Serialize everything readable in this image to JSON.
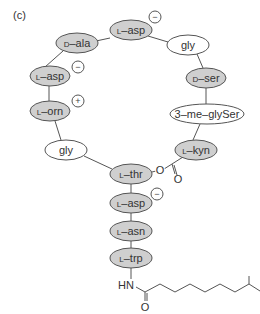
{
  "panel_label": "(c)",
  "colors": {
    "shaded_fill": "#cfcfcf",
    "white_fill": "#ffffff",
    "stroke": "#555555",
    "text": "#333333"
  },
  "nodes": [
    {
      "id": "l-asp-1",
      "prefix": "L",
      "name": "asp",
      "cx": 131,
      "cy": 30,
      "rx": 21,
      "ry": 10,
      "shaded": true
    },
    {
      "id": "d-ala",
      "prefix": "D",
      "name": "ala",
      "cx": 77,
      "cy": 43,
      "rx": 21,
      "ry": 10,
      "shaded": true
    },
    {
      "id": "gly-1",
      "prefix": "",
      "name": "gly",
      "cx": 188,
      "cy": 45,
      "rx": 21,
      "ry": 10,
      "shaded": false
    },
    {
      "id": "l-asp-2",
      "prefix": "L",
      "name": "asp",
      "cx": 50,
      "cy": 76,
      "rx": 20,
      "ry": 10,
      "shaded": true
    },
    {
      "id": "d-ser",
      "prefix": "D",
      "name": "ser",
      "cx": 206,
      "cy": 78,
      "rx": 20,
      "ry": 10,
      "shaded": true
    },
    {
      "id": "l-orn",
      "prefix": "L",
      "name": "orn",
      "cx": 50,
      "cy": 111,
      "rx": 20,
      "ry": 10,
      "shaded": true
    },
    {
      "id": "3-me-glyser",
      "prefix": "",
      "name": "3–me–glySer",
      "cx": 207,
      "cy": 114,
      "rx": 37,
      "ry": 10,
      "shaded": false
    },
    {
      "id": "gly-2",
      "prefix": "",
      "name": "gly",
      "cx": 66,
      "cy": 150,
      "rx": 21,
      "ry": 10,
      "shaded": false
    },
    {
      "id": "l-kyn",
      "prefix": "L",
      "name": "kyn",
      "cx": 196,
      "cy": 150,
      "rx": 21,
      "ry": 10,
      "shaded": true
    },
    {
      "id": "l-thr",
      "prefix": "L",
      "name": "thr",
      "cx": 131,
      "cy": 174,
      "rx": 21,
      "ry": 10,
      "shaded": true
    },
    {
      "id": "l-asp-3",
      "prefix": "L",
      "name": "asp",
      "cx": 131,
      "cy": 203,
      "rx": 21,
      "ry": 10,
      "shaded": true
    },
    {
      "id": "l-asn",
      "prefix": "L",
      "name": "asn",
      "cx": 131,
      "cy": 231,
      "rx": 21,
      "ry": 10,
      "shaded": true
    },
    {
      "id": "l-trp",
      "prefix": "L",
      "name": "trp",
      "cx": 131,
      "cy": 258,
      "rx": 21,
      "ry": 10,
      "shaded": true
    }
  ],
  "charges": [
    {
      "sign": "−",
      "cx": 155,
      "cy": 17,
      "near": "l-asp-1"
    },
    {
      "sign": "−",
      "cx": 78,
      "cy": 67,
      "near": "l-asp-2"
    },
    {
      "sign": "+",
      "cx": 78,
      "cy": 101,
      "near": "l-orn"
    },
    {
      "sign": "−",
      "cx": 157,
      "cy": 194,
      "near": "l-asp-3"
    }
  ],
  "bonds": [
    [
      110,
      38,
      96,
      41
    ],
    [
      148,
      36,
      168,
      42
    ],
    [
      197,
      54,
      203,
      68
    ],
    [
      63,
      51,
      45,
      67
    ],
    [
      49,
      86,
      49,
      101
    ],
    [
      206,
      88,
      206,
      104
    ],
    [
      55,
      121,
      61,
      140
    ],
    [
      200,
      124,
      193,
      140
    ],
    [
      84,
      156,
      112,
      169
    ],
    [
      131,
      184,
      131,
      193
    ],
    [
      131,
      213,
      131,
      221
    ],
    [
      131,
      241,
      131,
      248
    ],
    [
      131,
      268,
      131,
      279
    ],
    [
      152,
      172,
      156,
      171
    ],
    [
      164,
      169,
      172,
      164
    ],
    [
      172,
      164,
      183,
      157
    ],
    [
      172,
      164,
      175,
      174
    ],
    [
      174,
      165,
      177,
      175
    ]
  ],
  "ester": {
    "o_label": "O",
    "o_x": 160,
    "o_y": 174,
    "carbonyl_o_label": "O",
    "carbonyl_o_x": 178,
    "carbonyl_o_y": 183
  },
  "tail": {
    "hn_label": "HN",
    "hn_x": 118,
    "hn_y": 289,
    "o_label": "O",
    "o_x": 145,
    "o_y": 311,
    "chain_points": "136,287 145,292 160,284 175,292 190,284 205,292 220,284 235,292 249,284 260,291",
    "carbonyl": [
      145,
      292,
      145,
      301
    ],
    "carbonyl2": [
      147,
      293,
      147,
      301
    ],
    "branch": [
      249,
      284,
      249,
      276
    ]
  }
}
